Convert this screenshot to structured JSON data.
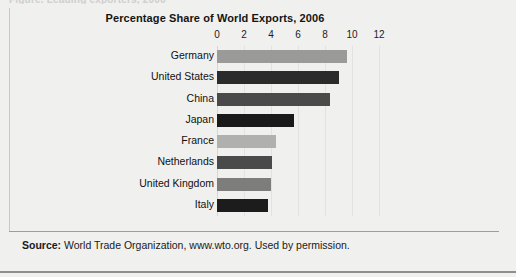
{
  "figure": {
    "clipped_top_text": "Figure.  Leading exporters, 2006",
    "background_color": "#f0f0ee"
  },
  "chart_data": {
    "type": "bar",
    "orientation": "horizontal",
    "title": "Percentage Share of World Exports, 2006",
    "xlabel": "",
    "ylabel": "",
    "xlim": [
      0,
      13.55
    ],
    "grid": true,
    "legend": "none",
    "tick_labels": [
      "0",
      "2",
      "4",
      "6",
      "8",
      "10",
      "12"
    ],
    "ticks": [
      0,
      2,
      4,
      6,
      8,
      10,
      12
    ],
    "categories": [
      "Germany",
      "United States",
      "China",
      "Japan",
      "France",
      "Netherlands",
      "United Kingdom",
      "Italy"
    ],
    "values": [
      9.6,
      9.0,
      8.4,
      5.7,
      4.4,
      4.1,
      4.0,
      3.8
    ],
    "colors": [
      "#9a9a98",
      "#2b2b2b",
      "#4a4a4a",
      "#1a1a1a",
      "#b0b0ae",
      "#4a4a4a",
      "#7d7d7b",
      "#1c1c1c"
    ]
  },
  "footer": {
    "source_label": "Source:",
    "source_text": "World Trade Organization, www.wto.org. Used by permission."
  }
}
